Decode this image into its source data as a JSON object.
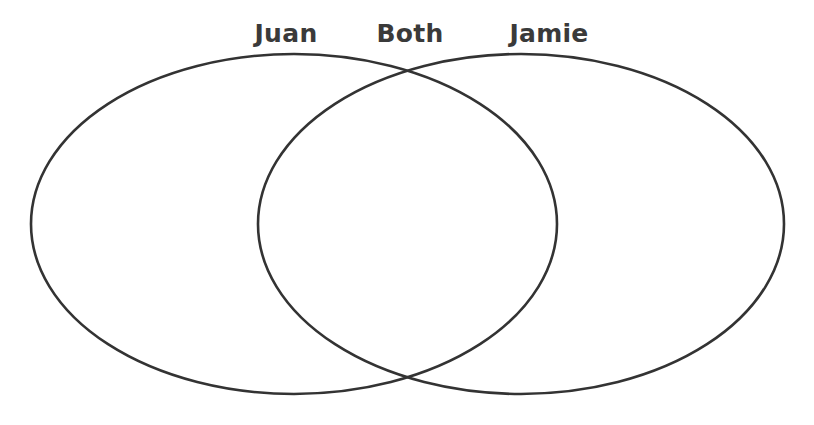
{
  "diagram": {
    "type": "venn-diagram",
    "sets": 2,
    "background_color": "#ffffff",
    "stroke_color": "#333333",
    "label_color": "#3a3a3a",
    "stroke_width": 2.6,
    "labels": {
      "left": "Juan",
      "overlap": "Both",
      "right": "Jamie"
    },
    "regions": [
      {
        "id": "left-only",
        "label": "Juan",
        "contents": []
      },
      {
        "id": "intersection",
        "label": "Both",
        "contents": []
      },
      {
        "id": "right-only",
        "label": "Jamie",
        "contents": []
      }
    ],
    "geometry": {
      "canvas_width": 814,
      "canvas_height": 425,
      "left_ellipse": {
        "cx": 294,
        "cy": 224,
        "rx": 263,
        "ry": 170
      },
      "right_ellipse": {
        "cx": 521,
        "cy": 224,
        "rx": 263,
        "ry": 170
      }
    }
  }
}
